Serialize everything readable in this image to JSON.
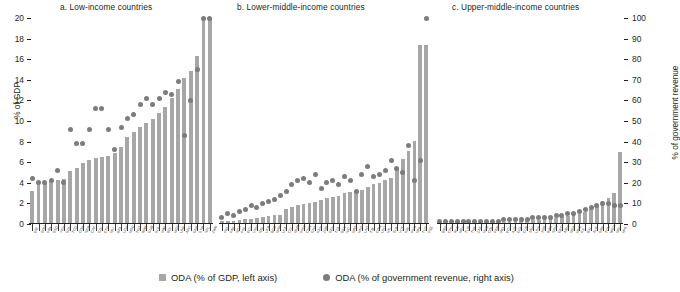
{
  "chart_data": {
    "type": "bar",
    "title": "",
    "ylabel": "% of GDP",
    "ylabel_right": "% of government revenue",
    "ylim": [
      0,
      20
    ],
    "ylim_right": [
      0,
      100
    ],
    "yticks": [
      0,
      2,
      4,
      6,
      8,
      10,
      12,
      14,
      16,
      18,
      20
    ],
    "yticks_right": [
      0,
      10,
      20,
      30,
      40,
      50,
      60,
      70,
      80,
      90,
      100
    ],
    "grid": false,
    "legend_position": "bottom",
    "series": [
      {
        "name": "ODA (% of GDP, left axis)",
        "type": "bar",
        "axis": "left",
        "color": "#a7a7a7"
      },
      {
        "name": "ODA (% of government revenue, right axis)",
        "type": "scatter",
        "axis": "right",
        "color": "#7c7c7c"
      }
    ],
    "panels": [
      {
        "title": "a. Low-income countries",
        "categories": [
          "ERI",
          "SOM",
          "PRK",
          "SSD",
          "YEM",
          "SDN",
          "TCD",
          "COD",
          "NER",
          "CAF",
          "GIN",
          "ETH",
          "MLI",
          "BFA",
          "UGA",
          "MDG",
          "TGO",
          "RWA",
          "GMB",
          "SLE",
          "MWI",
          "BDI",
          "MOZ",
          "LBR",
          "AFG",
          "GNB",
          "SYR",
          "NPL",
          "ZWE"
        ],
        "values": [
          3.2,
          3.9,
          4.0,
          4.1,
          4.3,
          4.4,
          5.1,
          5.4,
          5.9,
          6.2,
          6.4,
          6.5,
          6.6,
          6.9,
          7.5,
          8.4,
          8.9,
          9.4,
          9.8,
          10.2,
          10.8,
          11.4,
          12.2,
          13.1,
          14.2,
          14.9,
          16.3,
          20.0,
          20.0
        ],
        "values_right": [
          22,
          20,
          20,
          21,
          26,
          20,
          46,
          39,
          39,
          46,
          56,
          56,
          46,
          36,
          47,
          51,
          53,
          58,
          61,
          58,
          61,
          64,
          63,
          69,
          43,
          60,
          75,
          100,
          100
        ],
        "clipped_bars": [
          27,
          28,
          29,
          30
        ],
        "note": "rightmost bars reach or exceed the 20% axis maximum"
      },
      {
        "title": "b. Lower-middle-income countries",
        "categories": [
          "IND",
          "PAK",
          "NGA",
          "PHL",
          "EGY",
          "VNM",
          "IDN",
          "UKR",
          "BGD",
          "MAR",
          "LKA",
          "CIV",
          "MMR",
          "KHM",
          "CMR",
          "GHA",
          "KEN",
          "ZMB",
          "SEN",
          "TZA",
          "BEN",
          "NIC",
          "MRT",
          "HND",
          "LAO",
          "TJK",
          "COM",
          "LSO",
          "HTI",
          "SLB",
          "VUT",
          "KIR",
          "FSM",
          "MHL",
          "TUV",
          "PSE"
        ],
        "values": [
          0.25,
          0.3,
          0.3,
          0.35,
          0.5,
          0.5,
          0.6,
          0.7,
          0.8,
          0.85,
          0.9,
          1.5,
          1.7,
          1.8,
          1.9,
          2.0,
          2.1,
          2.3,
          2.5,
          2.6,
          2.7,
          3.0,
          3.1,
          3.2,
          3.3,
          3.6,
          3.9,
          4.0,
          4.3,
          4.5,
          5.4,
          6.3,
          7.1,
          8.1,
          17.4,
          17.4
        ],
        "values_right": [
          3,
          5,
          4,
          6,
          7,
          9,
          8,
          10,
          11,
          12,
          14,
          16,
          19,
          21,
          22,
          20,
          24,
          17,
          20,
          21,
          19,
          23,
          21,
          16,
          24,
          28,
          23,
          24,
          26,
          31,
          27,
          25,
          38,
          21,
          31,
          100
        ],
        "note": "tallest bar about 17.4% of GDP; highest dot at about 100% of government revenue"
      },
      {
        "title": "c. Upper-middle-income countries",
        "categories": [
          "BRA",
          "CHN",
          "RUS",
          "MEX",
          "TUR",
          "THA",
          "ZAF",
          "MYS",
          "COL",
          "PER",
          "IRQ",
          "ECU",
          "AZE",
          "DZA",
          "CUB",
          "JAM",
          "LBN",
          "JOR",
          "BWA",
          "NAM",
          "GEO",
          "ARM",
          "MDA",
          "MNE",
          "FJI",
          "BIH",
          "ALB",
          "SRB",
          "TON",
          "WSM",
          "MDV",
          "MHL"
        ],
        "values": [
          0.05,
          0.05,
          0.05,
          0.05,
          0.05,
          0.05,
          0.08,
          0.08,
          0.1,
          0.1,
          0.12,
          0.15,
          0.15,
          0.2,
          0.25,
          0.3,
          0.35,
          0.4,
          0.45,
          0.5,
          0.6,
          0.7,
          0.8,
          0.9,
          1.0,
          1.2,
          1.5,
          1.8,
          2.2,
          2.5,
          3.0,
          7.0
        ],
        "values_right": [
          1,
          1,
          1,
          1,
          1,
          1,
          1,
          1,
          1,
          1,
          1,
          2,
          2,
          2,
          2,
          2,
          3,
          3,
          3,
          3,
          4,
          4,
          5,
          5,
          6,
          7,
          8,
          9,
          10,
          10,
          9,
          9
        ],
        "note": "last bar about 7% of GDP, roughly 35% of government revenue"
      }
    ],
    "legend": [
      "ODA (% of GDP, left axis)",
      "ODA (% of government revenue, right axis)"
    ]
  },
  "colors": {
    "bar": "#a7a7a7",
    "dot": "#7c7c7c",
    "text": "#231f20",
    "background": "#ffffff"
  }
}
